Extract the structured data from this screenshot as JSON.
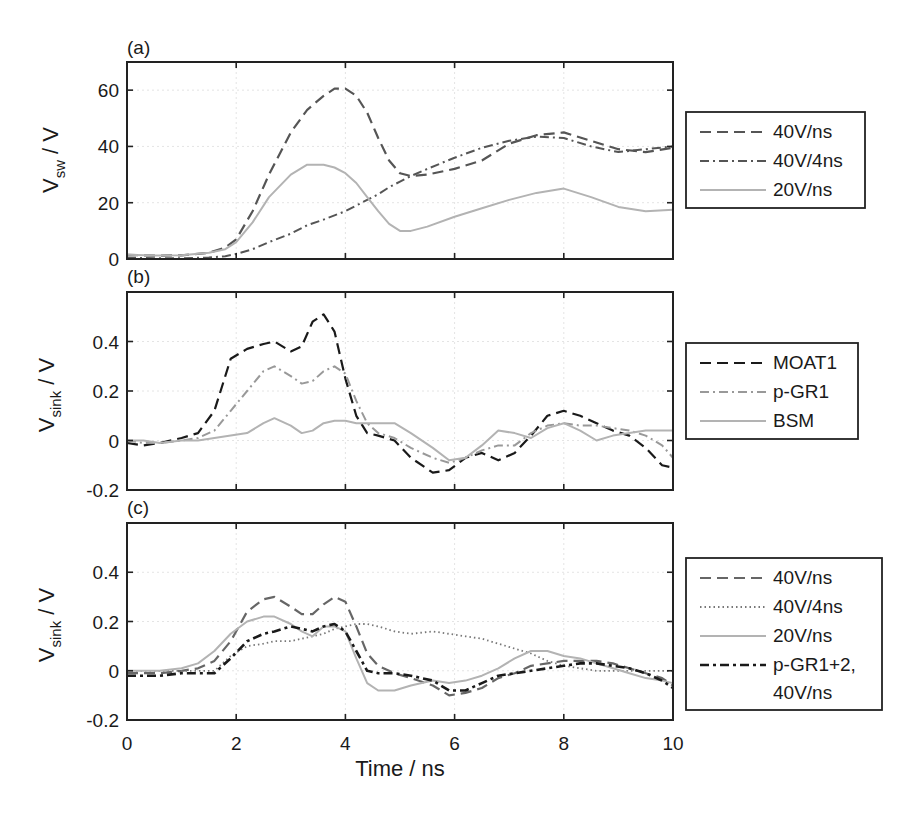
{
  "figure": {
    "x_axis_label": "Time / ns",
    "x_ticks": [
      "0",
      "2",
      "4",
      "6",
      "8",
      "10"
    ]
  },
  "chart_data": [
    {
      "type": "line",
      "panel": "(a)",
      "title": "",
      "xlabel": "Time / ns",
      "ylabel": "V_sw / V",
      "ylabel_main": "V",
      "ylabel_sub": "sw",
      "ylabel_unit": " / V",
      "xlim": [
        0,
        10
      ],
      "ylim": [
        0,
        70
      ],
      "x_ticks": [
        0,
        2,
        4,
        6,
        8,
        10
      ],
      "y_ticks": [
        0,
        20,
        40,
        60
      ],
      "y_tick_labels": [
        "0",
        "20",
        "40",
        "60"
      ],
      "grid": true,
      "legend_position": "outside right",
      "x": [
        0,
        0.5,
        1,
        1.5,
        1.8,
        2,
        2.3,
        2.6,
        3,
        3.3,
        3.6,
        3.8,
        4,
        4.2,
        4.4,
        4.6,
        4.8,
        5,
        5.2,
        5.5,
        6,
        6.5,
        7,
        7.5,
        8,
        8.5,
        9,
        9.5,
        10
      ],
      "series": [
        {
          "name": "40V/ns",
          "style": "dashed",
          "color": "#555555",
          "values": [
            1.5,
            1.2,
            1.3,
            2.2,
            4,
            7,
            17,
            30,
            45,
            53,
            58,
            60.5,
            60.5,
            58,
            52,
            43,
            35,
            30.5,
            29.5,
            30,
            32,
            35,
            41,
            44,
            45,
            42,
            39,
            38,
            39.5
          ]
        },
        {
          "name": "40V/4ns",
          "style": "dashdot",
          "color": "#555555",
          "values": [
            0.5,
            0.3,
            0.3,
            0.5,
            1,
            1.8,
            3.5,
            6,
            9,
            12,
            14,
            15.5,
            17,
            19,
            21,
            23,
            25.5,
            27.5,
            29.5,
            32,
            36,
            39.5,
            42,
            43.5,
            43,
            40,
            38,
            39,
            40
          ]
        },
        {
          "name": "20V/ns",
          "style": "solid",
          "color": "#b3b3b3",
          "values": [
            1.5,
            1.2,
            1.3,
            2.2,
            3.5,
            6,
            13,
            22,
            30,
            33.5,
            33.5,
            32.5,
            30.5,
            27,
            22,
            17,
            12.5,
            10,
            10,
            11.5,
            15,
            18,
            21,
            23.5,
            25,
            22,
            18.5,
            17,
            17.5
          ]
        }
      ]
    },
    {
      "type": "line",
      "panel": "(b)",
      "title": "",
      "xlabel": "Time / ns",
      "ylabel": "V_sink / V",
      "ylabel_main": "V",
      "ylabel_sub": "sink",
      "ylabel_unit": " / V",
      "xlim": [
        0,
        10
      ],
      "ylim": [
        -0.2,
        0.6
      ],
      "x_ticks": [
        0,
        2,
        4,
        6,
        8,
        10
      ],
      "y_ticks": [
        -0.2,
        0,
        0.2,
        0.4
      ],
      "y_tick_labels": [
        "-0.2",
        "0",
        "0.2",
        "0.4"
      ],
      "grid": true,
      "legend_position": "outside right",
      "x": [
        0,
        0.3,
        0.6,
        1,
        1.3,
        1.6,
        1.9,
        2.2,
        2.5,
        2.7,
        3.0,
        3.2,
        3.4,
        3.6,
        3.8,
        4.0,
        4.2,
        4.4,
        4.6,
        4.9,
        5.2,
        5.6,
        5.9,
        6.2,
        6.5,
        6.8,
        7.1,
        7.4,
        7.7,
        8.0,
        8.3,
        8.6,
        8.9,
        9.2,
        9.5,
        9.8,
        10
      ],
      "series": [
        {
          "name": "MOAT1",
          "style": "dashed",
          "color": "#1a1a1a",
          "values": [
            -0.01,
            -0.02,
            -0.01,
            0.01,
            0.03,
            0.12,
            0.33,
            0.37,
            0.39,
            0.4,
            0.36,
            0.38,
            0.48,
            0.51,
            0.44,
            0.25,
            0.1,
            0.03,
            0.02,
            0.0,
            -0.07,
            -0.13,
            -0.12,
            -0.07,
            -0.05,
            -0.08,
            -0.05,
            0.02,
            0.1,
            0.12,
            0.1,
            0.07,
            0.04,
            0.02,
            -0.03,
            -0.1,
            -0.11
          ]
        },
        {
          "name": "p-GR1",
          "style": "dashdot",
          "color": "#999999",
          "values": [
            0.0,
            -0.01,
            -0.01,
            0.0,
            0.01,
            0.04,
            0.12,
            0.2,
            0.28,
            0.3,
            0.26,
            0.23,
            0.24,
            0.28,
            0.3,
            0.27,
            0.16,
            0.07,
            0.03,
            0.01,
            -0.03,
            -0.07,
            -0.09,
            -0.07,
            -0.04,
            -0.02,
            -0.02,
            0.03,
            0.06,
            0.07,
            0.06,
            0.06,
            0.05,
            0.04,
            0.02,
            -0.02,
            -0.07
          ]
        },
        {
          "name": "BSM",
          "style": "solid",
          "color": "#b3b3b3",
          "values": [
            0.0,
            0.0,
            -0.01,
            0.0,
            0.0,
            0.01,
            0.02,
            0.03,
            0.07,
            0.09,
            0.06,
            0.03,
            0.04,
            0.07,
            0.08,
            0.08,
            0.07,
            0.07,
            0.07,
            0.07,
            0.03,
            -0.03,
            -0.08,
            -0.07,
            -0.02,
            0.04,
            0.03,
            0.01,
            0.05,
            0.07,
            0.04,
            0.0,
            0.02,
            0.03,
            0.04,
            0.04,
            0.04
          ]
        }
      ]
    },
    {
      "type": "line",
      "panel": "(c)",
      "title": "",
      "xlabel": "Time / ns",
      "ylabel": "V_sink / V",
      "ylabel_main": "V",
      "ylabel_sub": "sink",
      "ylabel_unit": " / V",
      "xlim": [
        0,
        10
      ],
      "ylim": [
        -0.2,
        0.6
      ],
      "x_ticks": [
        0,
        2,
        4,
        6,
        8,
        10
      ],
      "y_ticks": [
        -0.2,
        0,
        0.2,
        0.4
      ],
      "y_tick_labels": [
        "-0.2",
        "0",
        "0.2",
        "0.4"
      ],
      "grid": true,
      "legend_position": "outside right",
      "x": [
        0,
        0.3,
        0.6,
        1,
        1.3,
        1.6,
        1.9,
        2.2,
        2.5,
        2.7,
        3.0,
        3.2,
        3.4,
        3.6,
        3.8,
        4.0,
        4.2,
        4.4,
        4.6,
        4.9,
        5.2,
        5.6,
        5.9,
        6.2,
        6.5,
        6.8,
        7.1,
        7.4,
        7.7,
        8.0,
        8.3,
        8.6,
        8.9,
        9.2,
        9.5,
        9.8,
        10
      ],
      "series": [
        {
          "name": "40V/ns",
          "style": "dashed",
          "color": "#666666",
          "values": [
            -0.01,
            -0.01,
            -0.01,
            0.0,
            0.01,
            0.04,
            0.12,
            0.24,
            0.29,
            0.3,
            0.26,
            0.23,
            0.23,
            0.27,
            0.3,
            0.28,
            0.18,
            0.07,
            0.02,
            -0.01,
            -0.03,
            -0.06,
            -0.1,
            -0.09,
            -0.07,
            -0.03,
            -0.01,
            0.02,
            0.03,
            0.04,
            0.04,
            0.04,
            0.03,
            0.01,
            -0.01,
            -0.03,
            -0.06
          ]
        },
        {
          "name": "40V/4ns",
          "style": "dotted",
          "color": "#777777",
          "values": [
            0.0,
            0.0,
            0.0,
            0.0,
            0.0,
            0.0,
            0.06,
            0.1,
            0.11,
            0.12,
            0.12,
            0.13,
            0.14,
            0.15,
            0.17,
            0.18,
            0.19,
            0.19,
            0.18,
            0.16,
            0.15,
            0.16,
            0.15,
            0.14,
            0.13,
            0.11,
            0.09,
            0.07,
            0.04,
            0.02,
            0.01,
            0.0,
            0.0,
            0.0,
            0.0,
            0.0,
            0.0
          ]
        },
        {
          "name": "20V/ns",
          "style": "solid",
          "color": "#b3b3b3",
          "values": [
            0.0,
            0.0,
            0.0,
            0.01,
            0.03,
            0.08,
            0.15,
            0.2,
            0.22,
            0.22,
            0.19,
            0.16,
            0.14,
            0.18,
            0.18,
            0.16,
            0.05,
            -0.05,
            -0.08,
            -0.08,
            -0.06,
            -0.04,
            -0.05,
            -0.04,
            -0.02,
            0.01,
            0.05,
            0.08,
            0.08,
            0.06,
            0.05,
            0.03,
            0.01,
            -0.01,
            -0.03,
            -0.04,
            -0.05
          ]
        },
        {
          "name": "p-GR1+2, 40V/ns",
          "name_lines": [
            "p-GR1+2,",
            "40V/ns"
          ],
          "style": "dashdot-heavy",
          "color": "#1a1a1a",
          "values": [
            -0.02,
            -0.02,
            -0.02,
            -0.01,
            -0.01,
            -0.01,
            0.05,
            0.12,
            0.15,
            0.16,
            0.18,
            0.17,
            0.16,
            0.18,
            0.19,
            0.16,
            0.08,
            0.0,
            -0.01,
            -0.01,
            -0.02,
            -0.04,
            -0.08,
            -0.08,
            -0.05,
            -0.02,
            -0.01,
            0.0,
            0.01,
            0.02,
            0.03,
            0.03,
            0.02,
            0.01,
            -0.01,
            -0.04,
            -0.07
          ]
        }
      ]
    }
  ]
}
